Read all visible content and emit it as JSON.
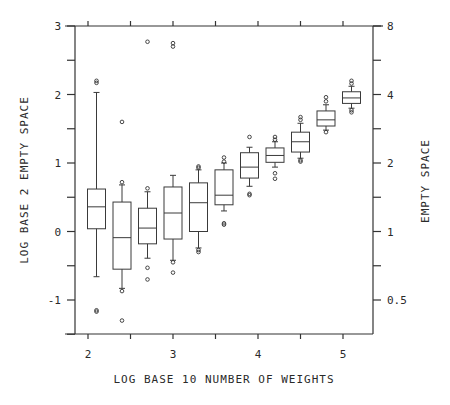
{
  "chart_data": {
    "type": "boxplot",
    "title": "",
    "xlabel": "LOG BASE 10 NUMBER OF WEIGHTS",
    "ylabel": "LOG BASE 2 EMPTY SPACE",
    "ylabel_right": "EMPTY SPACE",
    "xlim": [
      1.85,
      5.35
    ],
    "ylim": [
      -1.5,
      3
    ],
    "x_ticks": [
      2,
      2.5,
      3,
      3.5,
      4,
      4.5,
      5
    ],
    "x_tick_labels": [
      "2",
      "",
      "3",
      "",
      "4",
      "",
      "5"
    ],
    "y_ticks": [
      -1.5,
      -1,
      -0.5,
      0,
      0.5,
      1,
      1.5,
      2,
      2.5,
      3
    ],
    "y_tick_labels": [
      "",
      "-1",
      "",
      "0",
      "",
      "1",
      "",
      "2",
      "",
      "3"
    ],
    "y_right_ticks": [
      -1,
      -0.5,
      0,
      0.5,
      1,
      1.5,
      2,
      2.5,
      3
    ],
    "y_right_tick_labels": [
      "0.5",
      "",
      "1",
      "",
      "2",
      "",
      "4",
      "",
      "8"
    ],
    "grid": false,
    "boxes": [
      {
        "x": 2.1,
        "q1": 0.04,
        "median": 0.36,
        "q3": 0.62,
        "whisker_low": -0.66,
        "whisker_high": 2.03,
        "outliers": [
          2.2,
          2.17,
          -1.15,
          -1.17
        ]
      },
      {
        "x": 2.4,
        "q1": -0.55,
        "median": -0.09,
        "q3": 0.43,
        "whisker_low": -0.83,
        "whisker_high": 0.68,
        "outliers": [
          0.72,
          1.6,
          -0.87,
          -1.3
        ]
      },
      {
        "x": 2.7,
        "q1": -0.18,
        "median": 0.05,
        "q3": 0.34,
        "whisker_low": -0.39,
        "whisker_high": 0.58,
        "outliers": [
          0.63,
          -0.53,
          -0.7,
          2.77
        ]
      },
      {
        "x": 3.0,
        "q1": -0.11,
        "median": 0.27,
        "q3": 0.65,
        "whisker_low": -0.42,
        "whisker_high": 0.82,
        "outliers": [
          -0.45,
          -0.6,
          2.75,
          2.7
        ]
      },
      {
        "x": 3.3,
        "q1": 0.0,
        "median": 0.42,
        "q3": 0.71,
        "whisker_low": -0.24,
        "whisker_high": 0.9,
        "outliers": [
          0.93,
          0.95,
          -0.27,
          -0.3
        ]
      },
      {
        "x": 3.6,
        "q1": 0.39,
        "median": 0.53,
        "q3": 0.9,
        "whisker_low": 0.3,
        "whisker_high": 1.0,
        "outliers": [
          1.08,
          1.02,
          0.12,
          0.1
        ]
      },
      {
        "x": 3.9,
        "q1": 0.78,
        "median": 0.94,
        "q3": 1.15,
        "whisker_low": 0.66,
        "whisker_high": 1.23,
        "outliers": [
          1.38,
          0.55,
          0.53
        ]
      },
      {
        "x": 4.2,
        "q1": 1.01,
        "median": 1.11,
        "q3": 1.22,
        "whisker_low": 0.94,
        "whisker_high": 1.31,
        "outliers": [
          1.38,
          1.34,
          0.85,
          0.77
        ]
      },
      {
        "x": 4.5,
        "q1": 1.16,
        "median": 1.31,
        "q3": 1.45,
        "whisker_low": 1.07,
        "whisker_high": 1.58,
        "outliers": [
          1.67,
          1.63,
          1.04,
          1.02
        ]
      },
      {
        "x": 4.8,
        "q1": 1.54,
        "median": 1.63,
        "q3": 1.76,
        "whisker_low": 1.48,
        "whisker_high": 1.85,
        "outliers": [
          1.96,
          1.9,
          1.45
        ]
      },
      {
        "x": 5.1,
        "q1": 1.87,
        "median": 1.95,
        "q3": 2.04,
        "whisker_low": 1.8,
        "whisker_high": 2.12,
        "outliers": [
          2.2,
          2.16,
          1.77,
          1.74
        ]
      }
    ]
  }
}
